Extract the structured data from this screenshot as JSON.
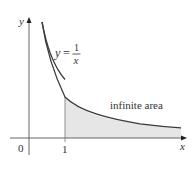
{
  "figure": {
    "curve_label": {
      "lhs": "y",
      "eq": "=",
      "numerator": "1",
      "denominator": "x"
    },
    "axis_labels": {
      "x": "x",
      "y": "y"
    },
    "tick_labels": {
      "origin": "0",
      "one": "1"
    },
    "area_label": "infinite area",
    "colors": {
      "curve": "#3a3a3a",
      "axis": "#666666",
      "shade": "#e6e6e6"
    }
  }
}
